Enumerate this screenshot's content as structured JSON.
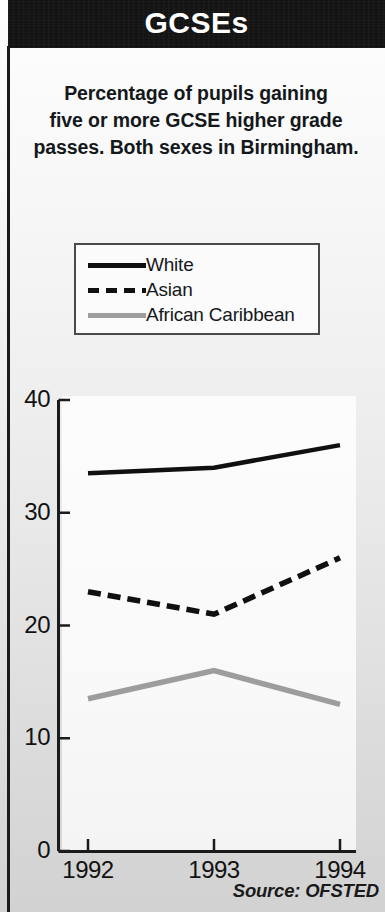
{
  "banner": {
    "title": "GCSEs"
  },
  "subtitle": {
    "line1": "Percentage of pupils gaining",
    "line2": "five or more GCSE higher grade",
    "line3": "passes. Both sexes in Birmingham."
  },
  "legend": {
    "entries": [
      {
        "label": "White",
        "style": "solid",
        "color": "#101010"
      },
      {
        "label": "Asian",
        "style": "dashed",
        "color": "#101010"
      },
      {
        "label": "African Caribbean",
        "style": "solid",
        "color": "#9d9d9d"
      }
    ]
  },
  "source": {
    "text": "Source: OFSTED"
  },
  "chart_data": {
    "type": "line",
    "title": "Percentage of pupils gaining five or more GCSE higher grade passes. Both sexes in Birmingham.",
    "xlabel": "",
    "ylabel": "",
    "x": [
      "1992",
      "1993",
      "1994"
    ],
    "categories": [
      "1992",
      "1993",
      "1994"
    ],
    "series": [
      {
        "name": "White",
        "values": [
          33.5,
          34.0,
          36.0
        ],
        "color": "#101010",
        "style": "solid"
      },
      {
        "name": "Asian",
        "values": [
          23.0,
          21.0,
          26.0
        ],
        "color": "#101010",
        "style": "dashed"
      },
      {
        "name": "African Caribbean",
        "values": [
          13.5,
          16.0,
          13.0
        ],
        "color": "#9d9d9d",
        "style": "solid"
      }
    ],
    "ylim": [
      0,
      40
    ],
    "yticks": [
      0,
      10,
      20,
      30,
      40
    ],
    "ytick_labels": [
      "0",
      "10",
      "20",
      "30",
      "40"
    ],
    "xtick_labels": [
      "1992",
      "1993",
      "1994"
    ],
    "grid": false,
    "legend_position": "above-plot"
  }
}
